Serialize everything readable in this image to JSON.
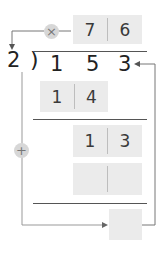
{
  "diagram": {
    "type": "long-division-check",
    "divisor": "2",
    "division_symbol": ")",
    "dividend": [
      "1",
      "5",
      "3"
    ],
    "quotient": [
      "7",
      "6"
    ],
    "multiply_icon": "×",
    "add_icon": "+",
    "partial_product_1": [
      "1",
      "4"
    ],
    "partial_product_2": [
      "1",
      "3"
    ],
    "blank_row": [
      "",
      ""
    ],
    "remainder_box": "",
    "colors": {
      "box": "#ebebeb",
      "circle": "#d7d7d7",
      "line": "#888888",
      "rule": "#555555"
    }
  }
}
